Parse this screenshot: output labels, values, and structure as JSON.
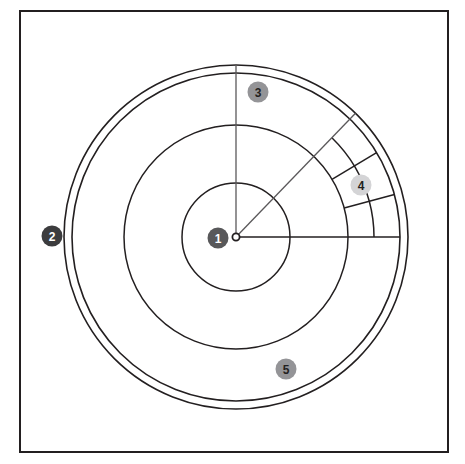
{
  "figure": {
    "canvas": {
      "width": 465,
      "height": 464
    },
    "background_color": "#ffffff",
    "frame": {
      "name": "outer-frame",
      "x": 20,
      "y": 11,
      "width": 428,
      "height": 441,
      "stroke_color": "#231f20",
      "stroke_width": 2.0,
      "fill": "none"
    },
    "geometry": {
      "center": {
        "x": 236,
        "y": 237
      },
      "line_color": "#231f20",
      "thin_line_color": "#5a585a",
      "circles": [
        {
          "name": "inner-circle",
          "radius": 54,
          "stroke_width": 1.5
        },
        {
          "name": "middle-circle",
          "radius": 112,
          "stroke_width": 1.5
        },
        {
          "name": "outer-circle-inner-rim",
          "radius": 164,
          "stroke_width": 1.6
        },
        {
          "name": "outer-circle-outer-rim",
          "radius": 172,
          "stroke_width": 1.6
        }
      ],
      "radial_lines": [
        {
          "name": "radius-horizontal-right",
          "angle_deg": 0,
          "r_start": 0,
          "r_end": 164,
          "stroke_width": 1.5,
          "tone": "dark"
        },
        {
          "name": "radius-vertical-up",
          "angle_deg": 90,
          "r_start": 0,
          "r_end": 172,
          "stroke_width": 1.3,
          "tone": "thin"
        },
        {
          "name": "radius-diagonal-45",
          "angle_deg": 46,
          "r_start": 0,
          "r_end": 172,
          "stroke_width": 1.3,
          "tone": "thin"
        },
        {
          "name": "sector-divider-15",
          "angle_deg": 15,
          "r_start": 112,
          "r_end": 164,
          "stroke_width": 1.5,
          "tone": "dark"
        },
        {
          "name": "sector-divider-31",
          "angle_deg": 31,
          "r_start": 112,
          "r_end": 164,
          "stroke_width": 1.5,
          "tone": "dark"
        }
      ],
      "sector_arcs": [
        {
          "name": "sector-arc-outer-band",
          "radius": 138,
          "start_deg": 15,
          "end_deg": 46,
          "stroke_width": 1.5
        },
        {
          "name": "sector-arc-mid-band",
          "radius": 138,
          "start_deg": 0,
          "end_deg": 15,
          "stroke_width": 1.5
        }
      ],
      "center_dot": {
        "name": "center-point-marker",
        "radius": 3.6,
        "fill": "#ffffff",
        "stroke_color": "#231f20",
        "stroke_width": 1.8
      }
    },
    "callouts": [
      {
        "id": "callout-1",
        "label": "1",
        "x": 218,
        "y": 238,
        "radius": 10.5,
        "fill": "#58585a",
        "text_color": "#ffffff",
        "font_size": 12,
        "description": "center point"
      },
      {
        "id": "callout-2",
        "label": "2",
        "x": 52,
        "y": 236,
        "radius": 10.5,
        "fill": "#3c3c3e",
        "text_color": "#ffffff",
        "font_size": 12,
        "description": "outer double ring"
      },
      {
        "id": "callout-3",
        "label": "3",
        "x": 258,
        "y": 92,
        "radius": 10.5,
        "fill": "#949497",
        "text_color": "#231f20",
        "font_size": 12,
        "description": "upper radial line"
      },
      {
        "id": "callout-4",
        "label": "4",
        "x": 361,
        "y": 185,
        "radius": 10.5,
        "fill": "#d4d4d6",
        "text_color": "#231f20",
        "font_size": 12,
        "description": "subdivided sector cells"
      },
      {
        "id": "callout-5",
        "label": "5",
        "x": 286,
        "y": 369,
        "radius": 10.5,
        "fill": "#949497",
        "text_color": "#231f20",
        "font_size": 12,
        "description": "lower ring band"
      }
    ]
  }
}
